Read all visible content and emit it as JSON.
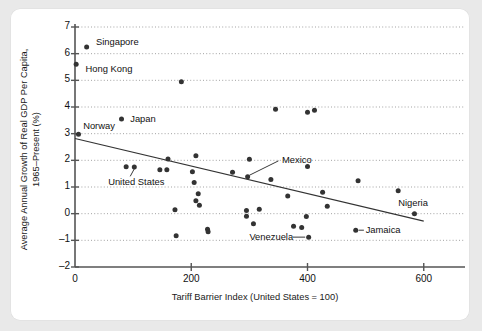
{
  "figure": {
    "background": "#e9e9e9",
    "card_background": "#ffffff",
    "axis_color": "#555555",
    "point_color": "#333333",
    "grid_color": "#999999",
    "trendline_color": "#333333"
  },
  "chart_data": {
    "type": "scatter",
    "title": "",
    "xlabel": "Tariff Barrier Index (United States = 100)",
    "ylabel": "Average Annual Growth of Real GDP Per Capita, 1965–Present (%)",
    "ylabel_line1": "Average Annual Growth of Real GDP Per Capita,",
    "ylabel_line2": "1965–Present (%)",
    "xlim": [
      0,
      640
    ],
    "ylim": [
      -2,
      7
    ],
    "xticks": [
      0,
      200,
      400,
      600
    ],
    "xticklabels": [
      "0",
      "200",
      "400",
      "600"
    ],
    "yticks": [
      -2,
      -1,
      0,
      1,
      2,
      3,
      4,
      5,
      6,
      7
    ],
    "yticklabels": [
      "–2",
      "–1",
      "0",
      "1",
      "2",
      "3",
      "4",
      "5",
      "6",
      "7"
    ],
    "grid": true,
    "grid_style": "dotted-horizontal",
    "legend": false,
    "points": [
      {
        "x": 20,
        "y": 6.25,
        "label": "Singapore"
      },
      {
        "x": 2,
        "y": 5.6,
        "label": "Hong Kong"
      },
      {
        "x": 183,
        "y": 4.95,
        "label": ""
      },
      {
        "x": 345,
        "y": 3.92,
        "label": ""
      },
      {
        "x": 400,
        "y": 3.8,
        "label": ""
      },
      {
        "x": 412,
        "y": 3.88,
        "label": ""
      },
      {
        "x": 80,
        "y": 3.55,
        "label": "Japan"
      },
      {
        "x": 6,
        "y": 2.98,
        "label": "Norway"
      },
      {
        "x": 208,
        "y": 2.17,
        "label": ""
      },
      {
        "x": 160,
        "y": 2.05,
        "label": ""
      },
      {
        "x": 300,
        "y": 2.04,
        "label": ""
      },
      {
        "x": 88,
        "y": 1.76,
        "label": ""
      },
      {
        "x": 102,
        "y": 1.75,
        "label": "United States"
      },
      {
        "x": 400,
        "y": 1.77,
        "label": ""
      },
      {
        "x": 146,
        "y": 1.65,
        "label": ""
      },
      {
        "x": 158,
        "y": 1.65,
        "label": ""
      },
      {
        "x": 202,
        "y": 1.57,
        "label": ""
      },
      {
        "x": 271,
        "y": 1.55,
        "label": ""
      },
      {
        "x": 297,
        "y": 1.38,
        "label": "Mexico"
      },
      {
        "x": 337,
        "y": 1.28,
        "label": ""
      },
      {
        "x": 487,
        "y": 1.23,
        "label": ""
      },
      {
        "x": 205,
        "y": 1.17,
        "label": ""
      },
      {
        "x": 556,
        "y": 0.86,
        "label": ""
      },
      {
        "x": 426,
        "y": 0.8,
        "label": ""
      },
      {
        "x": 212,
        "y": 0.75,
        "label": ""
      },
      {
        "x": 366,
        "y": 0.66,
        "label": ""
      },
      {
        "x": 208,
        "y": 0.48,
        "label": ""
      },
      {
        "x": 214,
        "y": 0.32,
        "label": ""
      },
      {
        "x": 434,
        "y": 0.28,
        "label": ""
      },
      {
        "x": 172,
        "y": 0.15,
        "label": ""
      },
      {
        "x": 317,
        "y": 0.17,
        "label": ""
      },
      {
        "x": 295,
        "y": 0.12,
        "label": ""
      },
      {
        "x": 584,
        "y": 0.0,
        "label": "Nigeria"
      },
      {
        "x": 295,
        "y": -0.1,
        "label": ""
      },
      {
        "x": 398,
        "y": -0.11,
        "label": ""
      },
      {
        "x": 307,
        "y": -0.38,
        "label": ""
      },
      {
        "x": 376,
        "y": -0.47,
        "label": ""
      },
      {
        "x": 390,
        "y": -0.52,
        "label": ""
      },
      {
        "x": 483,
        "y": -0.62,
        "label": "Jamaica"
      },
      {
        "x": 228,
        "y": -0.58,
        "label": ""
      },
      {
        "x": 229,
        "y": -0.68,
        "label": ""
      },
      {
        "x": 174,
        "y": -0.83,
        "label": ""
      },
      {
        "x": 402,
        "y": -0.88,
        "label": "Venezuela"
      }
    ],
    "trendline": {
      "x0": 0,
      "y0": 2.82,
      "x1": 600,
      "y1": -0.28
    },
    "annotations": [
      {
        "name": "singapore",
        "text": "Singapore",
        "x": 36,
        "y": 6.42,
        "anchor": "left"
      },
      {
        "name": "hong-kong",
        "text": "Hong Kong",
        "x": 18,
        "y": 5.42,
        "anchor": "left"
      },
      {
        "name": "japan",
        "text": "Japan",
        "x": 95,
        "y": 3.56,
        "anchor": "left"
      },
      {
        "name": "norway",
        "text": "Norway",
        "x": 14,
        "y": 3.28,
        "anchor": "left"
      },
      {
        "name": "united-states",
        "text": "United States",
        "x": 57,
        "y": 1.2,
        "anchor": "left"
      },
      {
        "name": "mexico",
        "text": "Mexico",
        "x": 356,
        "y": 2.02,
        "anchor": "left"
      },
      {
        "name": "venezuela",
        "text": "Venezuela",
        "x": 300,
        "y": -0.87,
        "anchor": "left"
      },
      {
        "name": "jamaica",
        "text": "Jamaica",
        "x": 500,
        "y": -0.63,
        "anchor": "left"
      },
      {
        "name": "nigeria",
        "text": "Nigeria",
        "x": 556,
        "y": 0.4,
        "anchor": "left"
      }
    ],
    "leader_lines": [
      {
        "name": "united-states-leader",
        "x0": 95,
        "y0": 1.4,
        "x1": 102,
        "y1": 1.68
      },
      {
        "name": "mexico-leader",
        "x0": 350,
        "y0": 1.98,
        "x1": 300,
        "y1": 1.44
      },
      {
        "name": "venezuela-leader",
        "x0": 375,
        "y0": -0.88,
        "x1": 396,
        "y1": -0.88
      },
      {
        "name": "jamaica-leader",
        "x0": 488,
        "y0": -0.62,
        "x1": 497,
        "y1": -0.62
      }
    ]
  }
}
